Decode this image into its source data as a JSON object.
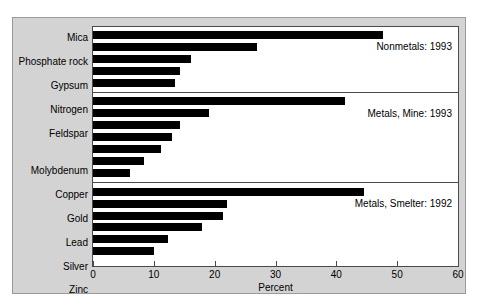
{
  "chart_data": {
    "type": "bar",
    "orientation": "horizontal",
    "title": "",
    "xlabel": "Percent",
    "ylabel": "",
    "xlim": [
      0,
      60
    ],
    "xticks": [
      0,
      10,
      20,
      30,
      40,
      50,
      60
    ],
    "grid": false,
    "legend_position": "inside-right",
    "bar_color": "#000000",
    "background_color": "#d3d3d3",
    "plot_background_color": "#ffffff",
    "groups": [
      {
        "label": "Nonmetals: 1993",
        "categories": [
          "Mica",
          "Phosphate rock",
          "Gypsum",
          "Nitrogen",
          "Feldspar"
        ],
        "values": [
          47.7,
          26.9,
          16.1,
          14.3,
          13.5
        ]
      },
      {
        "label": "Metals, Mine: 1993",
        "categories": [
          "Molybdenum",
          "Copper",
          "Gold",
          "Lead",
          "Silver",
          "Zinc",
          "Iron ore"
        ],
        "values": [
          41.5,
          19.0,
          14.3,
          13.0,
          11.2,
          8.4,
          6.1
        ]
      },
      {
        "label": "Metals, Smelter: 1992",
        "categories": [
          "Magnesium",
          "Lead",
          "Aluminium",
          "Copper",
          "Raw steel",
          "Pig iron"
        ],
        "values": [
          44.6,
          22.0,
          21.3,
          17.9,
          12.3,
          10.0
        ]
      }
    ],
    "categories": [
      "Mica",
      "Phosphate rock",
      "Gypsum",
      "Nitrogen",
      "Feldspar",
      "Molybdenum",
      "Copper",
      "Gold",
      "Lead",
      "Silver",
      "Zinc",
      "Iron ore",
      "Magnesium",
      "Lead",
      "Aluminium",
      "Copper",
      "Raw steel",
      "Pig iron"
    ],
    "values": [
      47.7,
      26.9,
      16.1,
      14.3,
      13.5,
      41.5,
      19.0,
      14.3,
      13.0,
      11.2,
      8.4,
      6.1,
      44.6,
      22.0,
      21.3,
      17.9,
      12.3,
      10.0
    ]
  }
}
